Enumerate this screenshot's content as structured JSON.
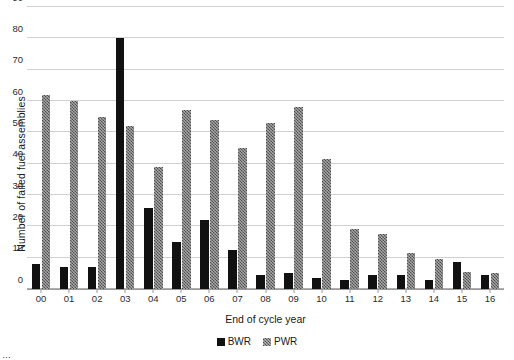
{
  "chart_data": {
    "type": "bar",
    "title": "",
    "subtitle": "",
    "xlabel": "End of cycle year",
    "ylabel": "Number of failed fuel assemblies",
    "categories": [
      "00",
      "01",
      "02",
      "03",
      "04",
      "05",
      "06",
      "07",
      "08",
      "09",
      "10",
      "11",
      "12",
      "13",
      "14",
      "15",
      "16"
    ],
    "series": [
      {
        "name": "BWR",
        "color": "#111111",
        "values": [
          8,
          7,
          7,
          80,
          26,
          15,
          22,
          12.5,
          4.5,
          5,
          3.5,
          3,
          4.5,
          4.5,
          3,
          8.5,
          4.5
        ]
      },
      {
        "name": "PWR",
        "color": "#6f6f6f",
        "values": [
          62,
          60,
          55,
          52,
          39,
          57,
          54,
          45,
          53,
          58,
          41.5,
          19,
          17.5,
          11.5,
          9.5,
          5.5,
          5
        ]
      }
    ],
    "ylim": [
      0,
      90
    ],
    "yticks": [
      0,
      10,
      20,
      30,
      40,
      50,
      60,
      70,
      80,
      90
    ],
    "ytick_labels": [
      "0",
      "10",
      "20",
      "30",
      "40",
      "50",
      "60",
      "70",
      "80",
      "90"
    ],
    "grid": "horizontal",
    "legend_position": "bottom-center",
    "legend_entries": [
      "BWR",
      "PWR"
    ]
  },
  "caption": {
    "fragment": "…"
  }
}
